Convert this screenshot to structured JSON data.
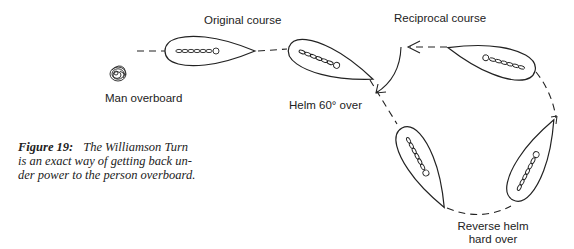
{
  "labels": {
    "original_course": "Original course",
    "reciprocal_course": "Reciprocal course",
    "man_overboard": "Man overboard",
    "helm_60": "Helm 60° over",
    "reverse_helm_line1": "Reverse helm",
    "reverse_helm_line2": "hard over"
  },
  "caption": {
    "figure_label": "Figure 19:",
    "line1": "The Williamson Turn",
    "line2": "is an exact way of getting back un-",
    "line3": "der power to the person overboard."
  },
  "icons": {
    "man_overboard": "swirl-person-in-water-icon",
    "boat": "boat-hull-icon"
  },
  "colors": {
    "ink": "#222222",
    "background": "#ffffff"
  }
}
